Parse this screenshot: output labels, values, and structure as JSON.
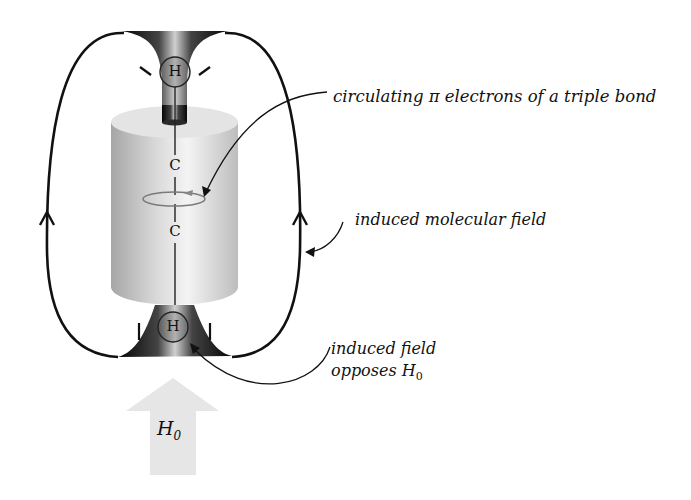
{
  "diagram": {
    "atoms": {
      "top_h": "H",
      "c1": "C",
      "c2": "C",
      "bottom_h": "H"
    },
    "labels": {
      "pi_electrons": "circulating π electrons of a triple bond",
      "molecular_field": "induced molecular field",
      "induced_field_line1": "induced field",
      "induced_field_line2_prefix": "opposes H",
      "induced_field_line2_sub": "0"
    },
    "applied_field": {
      "symbol": "H",
      "subscript": "0"
    },
    "colors": {
      "field_lines": "#111111",
      "cylinder_light": "#f2f2f2",
      "cylinder_dark": "#a9a9a9",
      "funnel_dark": "#111111",
      "arrow_fill": "#e6e6e6"
    }
  }
}
